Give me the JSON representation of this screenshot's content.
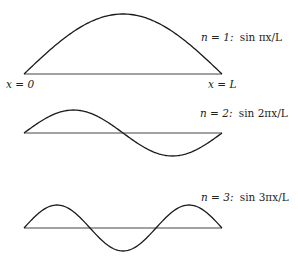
{
  "colors": {
    "curve": "#1a1a1a",
    "baseline": "#444444",
    "text": "#222222"
  },
  "endpoints": {
    "left": "x = 0",
    "right": "x = L"
  },
  "modes": [
    {
      "n": 1,
      "label_n": "n = 1:",
      "label_fn": "sin πx/L",
      "half_wavelengths": 1
    },
    {
      "n": 2,
      "label_n": "n = 2:",
      "label_fn": "sin 2πx/L",
      "half_wavelengths": 2
    },
    {
      "n": 3,
      "label_n": "n = 3:",
      "label_fn": "sin 3πx/L",
      "half_wavelengths": 3
    }
  ]
}
